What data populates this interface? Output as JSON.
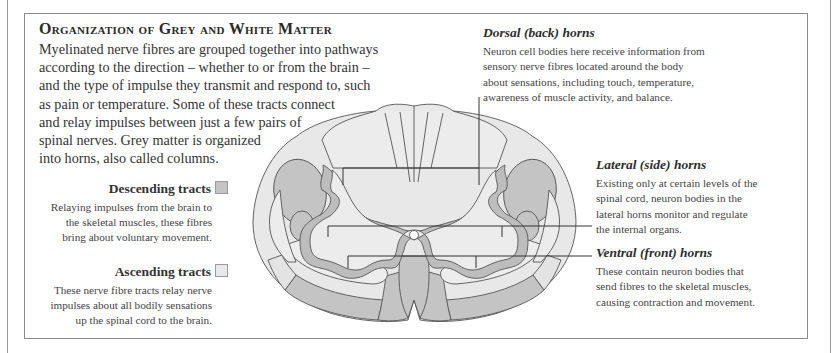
{
  "title": "Organization of Grey and White Matter",
  "intro": {
    "lines": [
      "Myelinated nerve fibres are grouped together into pathways",
      "according to the direction – whether to or from the brain –",
      "and the type of impulse they transmit and respond to, such",
      "as pain or temperature. Some of these tracts connect",
      "and relay impulses between just a few pairs of",
      "spinal nerves. Grey matter is organized",
      "into horns, also called columns."
    ]
  },
  "legend": [
    {
      "label": "Descending tracts",
      "swatch_color": "#c4c4c4",
      "lines": [
        "Relaying impulses from the brain to",
        "the skeletal muscles, these fibres",
        "bring about voluntary movement."
      ]
    },
    {
      "label": "Ascending tracts",
      "swatch_color": "#e6e6e6",
      "lines": [
        "These nerve fibre tracts relay nerve",
        "impulses about all bodily sensations",
        "up the spinal cord to the brain."
      ]
    }
  ],
  "annotations": {
    "dorsal": {
      "heading": "Dorsal (back) horns",
      "lines": [
        "Neuron cell bodies here receive information from",
        "sensory nerve fibres located around the body",
        "about sensations, including touch, temperature,",
        "awareness of muscle activity, and balance."
      ]
    },
    "lateral": {
      "heading": "Lateral (side) horns",
      "lines": [
        "Existing only at certain levels of the",
        "spinal cord, neuron bodies in the",
        "lateral horns monitor and regulate",
        "the internal organs."
      ]
    },
    "ventral": {
      "heading": "Ventral (front) horns",
      "lines": [
        "These contain neuron bodies that",
        "send fibres to the skeletal muscles,",
        "causing contraction and movement."
      ]
    }
  },
  "colors": {
    "descending": "#c4c4c4",
    "ascending": "#e6e6e6",
    "grey_matter_outline": "#bdbdbd",
    "grey_matter_fill": "#ececec",
    "outline": "#555555"
  }
}
